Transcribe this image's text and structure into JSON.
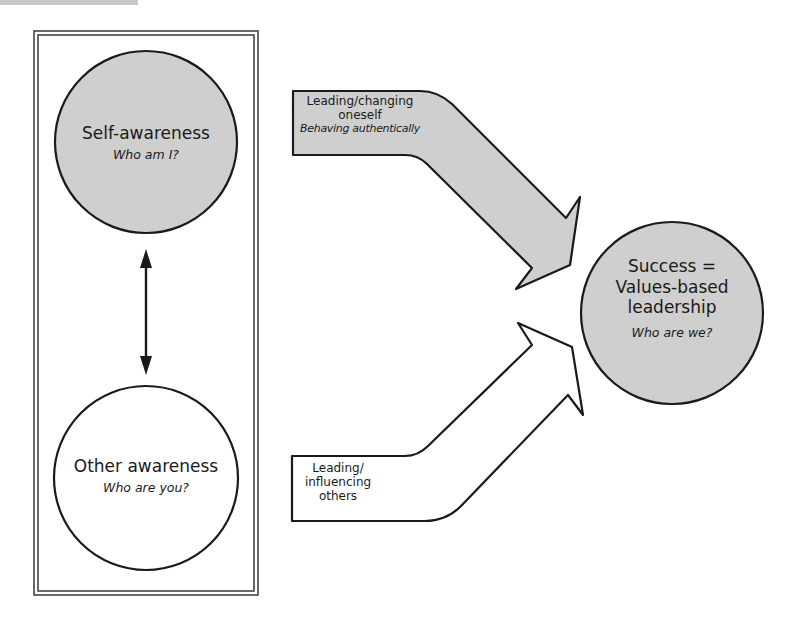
{
  "diagram": {
    "colors": {
      "shaded_fill": "#cfcfcf",
      "white_fill": "#ffffff",
      "stroke": "#1a1a1a",
      "box_stroke": "#555555"
    },
    "self_awareness": {
      "title": "Self-awareness",
      "question": "Who am I?"
    },
    "other_awareness": {
      "title": "Other awareness",
      "question": "Who are you?"
    },
    "top_arrow": {
      "line1": "Leading/changing",
      "line2": "oneself",
      "subtitle": "Behaving authentically"
    },
    "bottom_arrow": {
      "line1": "Leading/",
      "line2": "influencing",
      "line3": "others"
    },
    "success": {
      "line1": "Success =",
      "line2": "Values-based",
      "line3": "leadership",
      "question": "Who are we?"
    },
    "connector": {
      "type": "double-headed-arrow",
      "between": [
        "Self-awareness",
        "Other awareness"
      ]
    }
  }
}
